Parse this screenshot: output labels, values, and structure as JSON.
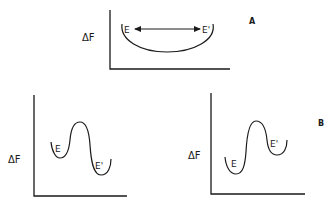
{
  "diagram": {
    "panel_a": {
      "label": "A",
      "y_axis_label": "ΔF",
      "state_left": "E",
      "state_right": "E'",
      "description": "Single broad free-energy well; E and E' interconvert freely (double-headed arrow)"
    },
    "panel_b_left": {
      "y_axis_label": "ΔF",
      "state_left": "E",
      "state_right": "E'",
      "description": "Double well separated by barrier; E' lower in free energy than E"
    },
    "panel_b_right": {
      "label": "B",
      "y_axis_label": "ΔF",
      "state_left": "E",
      "state_right": "E'",
      "description": "Double well separated by barrier; E lower in free energy than E'"
    }
  }
}
